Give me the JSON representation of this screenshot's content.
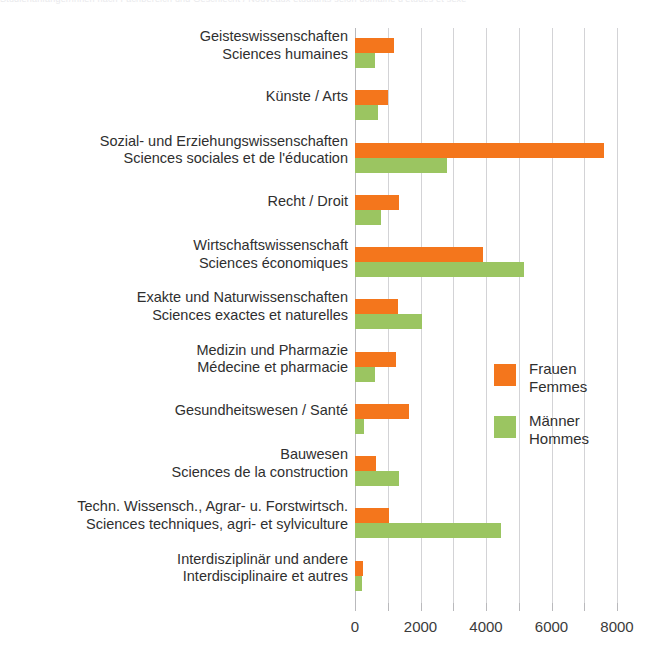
{
  "title_strip": "Studienanfänger/innen nach Fachbereich und Geschlecht / Nouveaux étudiants selon domaine d'études et sexe",
  "legend": {
    "women": {
      "line1": "Frauen",
      "line2": "Femmes",
      "color": "#F4761C"
    },
    "men": {
      "line1": "Männer",
      "line2": "Hommes",
      "color": "#9BC561"
    }
  },
  "axis": {
    "ticks": [
      0,
      1000,
      2000,
      3000,
      4000,
      5000,
      6000,
      7000,
      8000
    ],
    "tick_labels": [
      "0",
      "",
      "2000",
      "",
      "4000",
      "",
      "6000",
      "",
      "8000"
    ],
    "min": 0,
    "max": 8000
  },
  "chart_data": {
    "type": "bar",
    "orientation": "horizontal",
    "grouped": true,
    "title": "Studienanfänger/innen nach Fachbereich und Geschlecht / Nouveaux étudiants selon domaine d'études et sexe",
    "xlabel": "",
    "ylabel": "",
    "xlim": [
      0,
      8000
    ],
    "xticks": [
      0,
      1000,
      2000,
      3000,
      4000,
      5000,
      6000,
      7000,
      8000
    ],
    "xtick_labels": [
      "0",
      "",
      "2000",
      "",
      "4000",
      "",
      "6000",
      "",
      "8000"
    ],
    "grid": "vertical",
    "legend_position": "center-right",
    "categories": [
      {
        "de": "Geisteswissenschaften",
        "fr": "Sciences humaines"
      },
      {
        "de": "Künste / Arts",
        "fr": ""
      },
      {
        "de": "Sozial- und Erziehungswissenschaften",
        "fr": "Sciences sociales et de l'éducation"
      },
      {
        "de": "Recht / Droit",
        "fr": ""
      },
      {
        "de": "Wirtschaftswissenschaft",
        "fr": "Sciences économiques"
      },
      {
        "de": "Exakte und Naturwissenschaften",
        "fr": "Sciences exactes et naturelles"
      },
      {
        "de": "Medizin und Pharmazie",
        "fr": "Médecine et pharmacie"
      },
      {
        "de": "Gesundheitswesen / Santé",
        "fr": ""
      },
      {
        "de": "Bauwesen",
        "fr": "Sciences de la construction"
      },
      {
        "de": "Techn. Wissensch., Agrar- u. Forstwirtsch.",
        "fr": "Sciences techniques, agri- et sylviculture"
      },
      {
        "de": "Interdisziplinär und andere",
        "fr": "Interdisciplinaire et autres"
      }
    ],
    "series": [
      {
        "name": "Frauen / Femmes",
        "color": "#F4761C",
        "values": [
          1200,
          1000,
          7600,
          1350,
          3900,
          1300,
          1250,
          1650,
          650,
          1050,
          230
        ]
      },
      {
        "name": "Männer / Hommes",
        "color": "#9BC561",
        "values": [
          600,
          700,
          2800,
          800,
          5150,
          2050,
          600,
          280,
          1350,
          4450,
          200
        ]
      }
    ]
  }
}
